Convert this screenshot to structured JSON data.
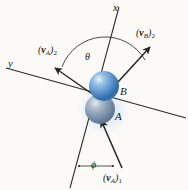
{
  "figure": {
    "background_color": "#fbfaf7",
    "line_color": "#2b2b2b"
  },
  "axes": {
    "x_label": "x",
    "y_label": "y"
  },
  "bodies": [
    {
      "id": "B",
      "label": "B",
      "color": "#4a86c8",
      "highlight": "#cfe2f4"
    },
    {
      "id": "A",
      "label": "A",
      "color": "#7e93ab",
      "highlight": "#d2dbe6"
    }
  ],
  "angles": [
    {
      "id": "theta",
      "symbol": "θ"
    },
    {
      "id": "phi",
      "symbol": "ϕ"
    }
  ],
  "vectors": [
    {
      "id": "vA2",
      "base": "v",
      "sub": "A",
      "index": "2",
      "text": "(vA)2"
    },
    {
      "id": "vB2",
      "base": "v",
      "sub": "B",
      "index": "2",
      "text": "(vB)2"
    },
    {
      "id": "vA1",
      "base": "v",
      "sub": "A",
      "index": "1",
      "text": "(vA)1"
    }
  ]
}
